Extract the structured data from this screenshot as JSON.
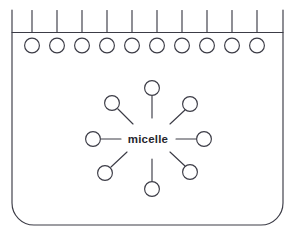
{
  "figure": {
    "label": "micelle",
    "stroke_color": "#3c3c46",
    "fill_color": "#ffffff",
    "background_color": "#ffffff"
  },
  "container": {
    "name": "beaker-outline",
    "left": 12,
    "right": 283,
    "top": 10,
    "bottom": 225,
    "corner_radius": 22,
    "interface_line_y": 32.5
  },
  "surface_layer": {
    "count": 10,
    "head_radius": 7.4,
    "head_center_y": 45.5,
    "tail_top_y": 10.5,
    "tail_bottom_y": 32.5,
    "first_center_x": 32,
    "spacing_x": 25,
    "centers_x": [
      32,
      57,
      82,
      107,
      132,
      157,
      182,
      207,
      232,
      257
    ]
  },
  "micelle": {
    "name": "central-micelle",
    "center_x": 148,
    "center_y": 139,
    "head_radius": 7.4,
    "head_distance": 56,
    "tail_inner_distance": 26,
    "molecules": [
      {
        "name": "micelle-molecule-n",
        "angle": -90,
        "head_x": 152,
        "head_y": 88,
        "tail_x1": 152,
        "tail_y1": 96,
        "tail_x2": 152,
        "tail_y2": 118
      },
      {
        "name": "micelle-molecule-ne",
        "angle": -45,
        "head_x": 190,
        "head_y": 104,
        "tail_x1": 185,
        "tail_y1": 110,
        "tail_x2": 170,
        "tail_y2": 124
      },
      {
        "name": "micelle-molecule-e",
        "angle": 0,
        "head_x": 204,
        "head_y": 139,
        "tail_x1": 196,
        "tail_y1": 139,
        "tail_x2": 176,
        "tail_y2": 139
      },
      {
        "name": "micelle-molecule-se",
        "angle": 45,
        "head_x": 190,
        "head_y": 172,
        "tail_x1": 185,
        "tail_y1": 166,
        "tail_x2": 170,
        "tail_y2": 152
      },
      {
        "name": "micelle-molecule-s",
        "angle": 90,
        "head_x": 152,
        "head_y": 189,
        "tail_x1": 152,
        "tail_y1": 181,
        "tail_x2": 152,
        "tail_y2": 159
      },
      {
        "name": "micelle-molecule-sw",
        "angle": 135,
        "head_x": 105,
        "head_y": 173,
        "tail_x1": 111,
        "tail_y1": 167,
        "tail_x2": 127,
        "tail_y2": 152
      },
      {
        "name": "micelle-molecule-w",
        "angle": 180,
        "head_x": 93,
        "head_y": 139,
        "tail_x1": 101,
        "tail_y1": 139,
        "tail_x2": 121,
        "tail_y2": 139
      },
      {
        "name": "micelle-molecule-nw",
        "angle": -135,
        "head_x": 112,
        "head_y": 103,
        "tail_x1": 118,
        "tail_y1": 109,
        "tail_x2": 133,
        "tail_y2": 124
      }
    ]
  },
  "label_position": {
    "x": 148,
    "y": 143
  }
}
